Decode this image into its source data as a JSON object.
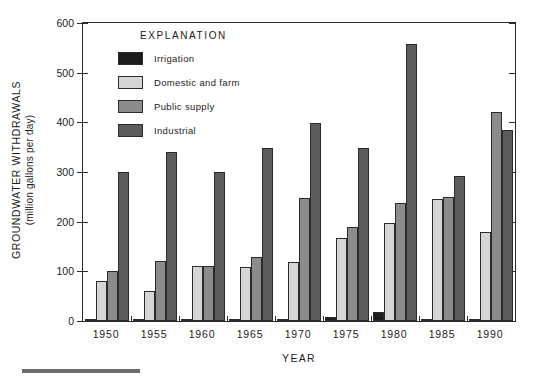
{
  "chart_data": {
    "type": "bar",
    "title": "",
    "xlabel": "YEAR",
    "ylabel": "GROUNDWATER WITHDRAWALS (million gallons per day)",
    "ylabel_line1": "GROUNDWATER  WITHDRAWALS",
    "ylabel_line2": "(million gallons per day)",
    "ylim": [
      0,
      600
    ],
    "yticks": [
      0,
      100,
      200,
      300,
      400,
      500,
      600
    ],
    "ytick_labels": [
      "0",
      "100",
      "200",
      "300",
      "400",
      "500",
      "600"
    ],
    "grid": false,
    "legend_position": "upper-center-left",
    "legend_title": "EXPLANATION",
    "categories": [
      "1950",
      "1955",
      "1960",
      "1965",
      "1970",
      "1975",
      "1980",
      "1985",
      "1990"
    ],
    "series": [
      {
        "name": "Irrigation",
        "color": "#1c1c1c",
        "values": [
          4,
          4,
          3,
          4,
          3,
          9,
          18,
          4,
          2
        ]
      },
      {
        "name": "Domestic and farm",
        "color": "#d6d6d6",
        "values": [
          80,
          60,
          110,
          108,
          118,
          168,
          197,
          245,
          180
        ]
      },
      {
        "name": "Public supply",
        "color": "#8c8c8c",
        "values": [
          100,
          120,
          110,
          129,
          248,
          190,
          237,
          250,
          420
        ]
      },
      {
        "name": "Industrial",
        "color": "#5c5c5c",
        "values": [
          300,
          340,
          300,
          348,
          399,
          348,
          557,
          292,
          385
        ]
      }
    ]
  },
  "colors": {
    "axis": "#2b2b2b",
    "text": "#1c1c1c",
    "background": "#ffffff",
    "footer_rule": "#6e6e6e"
  }
}
